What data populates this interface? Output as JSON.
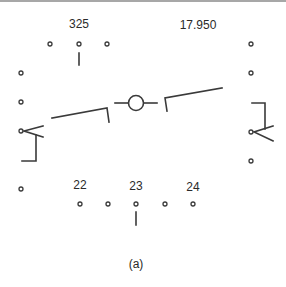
{
  "figure": {
    "caption": "(a)",
    "heading_readout": "325",
    "frequency_readout": "17.950",
    "scale_labels": [
      "22",
      "23",
      "24"
    ]
  },
  "symbols": {
    "flight_path_marker": "flight-path-marker-icon",
    "horizon_left": "horizon-bar-left",
    "horizon_right": "horizon-bar-right",
    "left_chevron": "chevron-left-icon",
    "right_chevron": "chevron-right-icon"
  },
  "colors": {
    "ink": "#3a3a3a",
    "background": "#ffffff",
    "border": "#8a8a8a"
  }
}
